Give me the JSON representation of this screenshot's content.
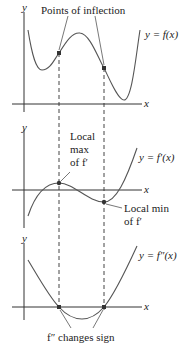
{
  "figure": {
    "top_panel": {
      "y_axis_label": "y",
      "x_axis_label": "x",
      "curve_label": "y = f(x)",
      "annotation": "Points of inflection"
    },
    "middle_panel": {
      "y_axis_label": "y",
      "x_axis_label": "x",
      "curve_label": "y = f′(x)",
      "max_label_line1": "Local",
      "max_label_line2": "max",
      "max_label_line3": "of f′",
      "min_label_line1": "Local min",
      "min_label_line2": "of f′"
    },
    "bottom_panel": {
      "y_axis_label": "y",
      "x_axis_label": "x",
      "curve_label": "y = f″(x)",
      "annotation": "f″ changes sign"
    },
    "colors": {
      "curve": "#555555",
      "axis": "#333333",
      "point": "#333333",
      "dashed": "#444444"
    }
  }
}
